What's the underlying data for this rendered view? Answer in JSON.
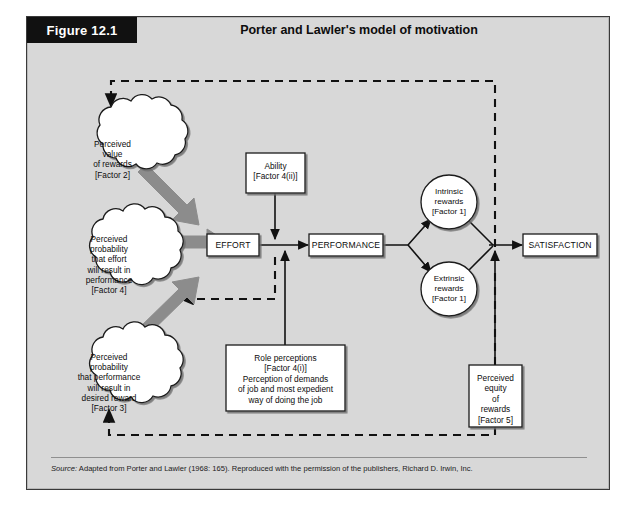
{
  "figure": {
    "tag": "Figure 12.1",
    "title": "Porter and Lawler's model of motivation",
    "source_label": "Source:",
    "source_text": " Adapted from Porter and Lawler (1968: 165). Reproduced with the permission of the publishers, Richard D. Irwin, Inc."
  },
  "colors": {
    "panel_background": "#d8d8d8",
    "node_fill": "#ffffff",
    "stroke": "#111111",
    "thick_arrow": "#8c8c8c",
    "tag_background": "#111111",
    "tag_text": "#ffffff"
  },
  "nodes": {
    "clouds": [
      {
        "id": "perceived-value-of-rewards",
        "lines": [
          "Perceived",
          "value",
          "of rewards",
          "[Factor 2]"
        ]
      },
      {
        "id": "perceived-probability-effort-performance",
        "lines": [
          "Perceived",
          "probability",
          "that effort",
          "will result in",
          "performance",
          "[Factor 4]"
        ]
      },
      {
        "id": "perceived-probability-performance-reward",
        "lines": [
          "Perceived",
          "probability",
          "that performance",
          "will result in",
          "desired reward",
          "[Factor 3]"
        ]
      }
    ],
    "ability": {
      "id": "ability",
      "lines": [
        "Ability",
        "[Factor 4(ii)]"
      ]
    },
    "effort": {
      "id": "effort",
      "label": "EFFORT"
    },
    "performance": {
      "id": "performance",
      "label": "PERFORMANCE"
    },
    "satisfaction": {
      "id": "satisfaction",
      "label": "SATISFACTION"
    },
    "role_perceptions": {
      "id": "role-perceptions",
      "lines": [
        "Role perceptions",
        "[Factor 4(i)]",
        "Perception of demands",
        "of job and most expedient",
        "way of doing the job"
      ]
    },
    "intrinsic": {
      "id": "intrinsic-rewards",
      "lines": [
        "Intrinsic",
        "rewards",
        "[Factor 1]"
      ]
    },
    "extrinsic": {
      "id": "extrinsic-rewards",
      "lines": [
        "Extrinsic",
        "rewards",
        "[Factor 1]"
      ]
    },
    "perceived_equity": {
      "id": "perceived-equity-of-rewards",
      "lines": [
        "Perceived",
        "equity",
        "of",
        "rewards",
        "[Factor 5]"
      ]
    }
  },
  "edges": {
    "solid": [
      "effort-to-performance",
      "ability-to-performance",
      "role-perceptions-to-performance",
      "performance-to-intrinsic",
      "performance-to-extrinsic",
      "intrinsic-to-satisfaction",
      "extrinsic-to-satisfaction",
      "perceived-equity-to-satisfaction"
    ],
    "thick_grey": [
      "perceived-value-to-effort",
      "perceived-probability-effort-to-effort",
      "perceived-probability-performance-to-effort"
    ],
    "dashed_feedback": [
      "satisfaction-to-perceived-value-of-rewards",
      "performance-to-perceived-probability-effort",
      "satisfaction-to-perceived-probability-performance"
    ]
  }
}
